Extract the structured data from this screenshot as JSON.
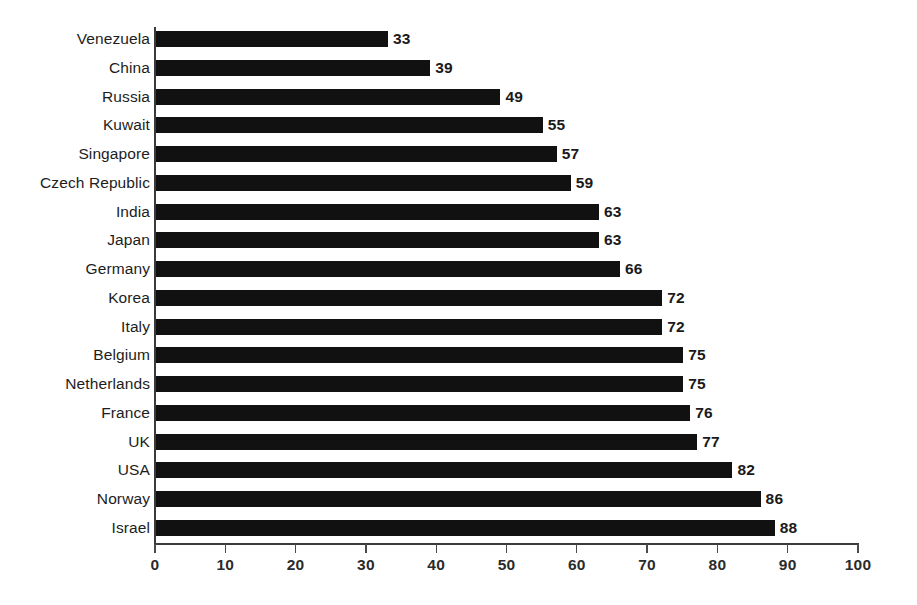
{
  "chart_data": {
    "type": "bar",
    "orientation": "horizontal",
    "title": "",
    "subtitle": "",
    "xlabel": "",
    "ylabel": "",
    "xlim": [
      0,
      100
    ],
    "xticks": [
      0,
      10,
      20,
      30,
      40,
      50,
      60,
      70,
      80,
      90,
      100
    ],
    "xtick_labels": [
      "0",
      "10",
      "20",
      "30",
      "40",
      "50",
      "60",
      "70",
      "80",
      "90",
      "100"
    ],
    "grid": false,
    "legend": null,
    "bar_color": "#111111",
    "axis_color": "#3b3b3b",
    "background_color": "#ffffff",
    "show_value_labels": true,
    "categories": [
      "Venezuela",
      "China",
      "Russia",
      "Kuwait",
      "Singapore",
      "Czech Republic",
      "India",
      "Japan",
      "Germany",
      "Korea",
      "Italy",
      "Belgium",
      "Netherlands",
      "France",
      "UK",
      "USA",
      "Norway",
      "Israel"
    ],
    "values": [
      33,
      39,
      49,
      55,
      57,
      59,
      63,
      63,
      66,
      72,
      72,
      75,
      75,
      76,
      77,
      82,
      86,
      88
    ],
    "value_labels": [
      "33",
      "39",
      "49",
      "55",
      "57",
      "59",
      "63",
      "63",
      "66",
      "72",
      "72",
      "75",
      "75",
      "76",
      "77",
      "82",
      "86",
      "88"
    ],
    "bars": [
      {
        "category": "Venezuela",
        "value": 33,
        "label": "33"
      },
      {
        "category": "China",
        "value": 39,
        "label": "39"
      },
      {
        "category": "Russia",
        "value": 49,
        "label": "49"
      },
      {
        "category": "Kuwait",
        "value": 55,
        "label": "55"
      },
      {
        "category": "Singapore",
        "value": 57,
        "label": "57"
      },
      {
        "category": "Czech Republic",
        "value": 59,
        "label": "59"
      },
      {
        "category": "India",
        "value": 63,
        "label": "63"
      },
      {
        "category": "Japan",
        "value": 63,
        "label": "63"
      },
      {
        "category": "Germany",
        "value": 66,
        "label": "66"
      },
      {
        "category": "Korea",
        "value": 72,
        "label": "72"
      },
      {
        "category": "Italy",
        "value": 72,
        "label": "72"
      },
      {
        "category": "Belgium",
        "value": 75,
        "label": "75"
      },
      {
        "category": "Netherlands",
        "value": 75,
        "label": "75"
      },
      {
        "category": "France",
        "value": 76,
        "label": "76"
      },
      {
        "category": "UK",
        "value": 77,
        "label": "77"
      },
      {
        "category": "USA",
        "value": 82,
        "label": "82"
      },
      {
        "category": "Norway",
        "value": 86,
        "label": "86"
      },
      {
        "category": "Israel",
        "value": 88,
        "label": "88"
      }
    ]
  }
}
